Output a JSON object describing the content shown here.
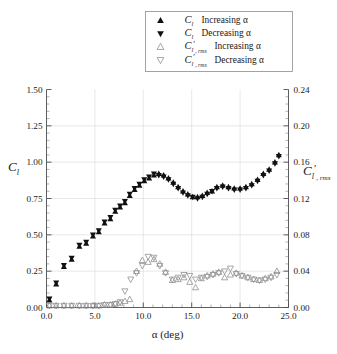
{
  "figure": {
    "background": "#ffffff",
    "marker_fill_color": "#111111",
    "marker_open_stroke_color": "#8a8a8a",
    "grid_color": "#d9d9d9",
    "axis_color": "#4d4d4d"
  },
  "legend": {
    "position": "top-center",
    "entries": [
      {
        "marker": "filled-triangle-up",
        "symbol": "C",
        "symbol_sub": "l",
        "symbol_prime": "",
        "symbol_sub2": "",
        "text": "Increasing α"
      },
      {
        "marker": "filled-triangle-down",
        "symbol": "C",
        "symbol_sub": "l",
        "symbol_prime": "",
        "symbol_sub2": "",
        "text": "Decreasing α"
      },
      {
        "marker": "open-triangle-up",
        "symbol": "C",
        "symbol_sub": "l",
        "symbol_prime": "′",
        "symbol_sub2": ", rms",
        "text": "Increasing α"
      },
      {
        "marker": "open-triangle-down",
        "symbol": "C",
        "symbol_sub": "l",
        "symbol_prime": "′",
        "symbol_sub2": ", rms",
        "text": "Decreasing α"
      }
    ]
  },
  "axes": {
    "x": {
      "label": "α (deg)",
      "min": 0.0,
      "max": 25.0,
      "major_step": 5.0,
      "minor_step": 1.0,
      "tick_labels": [
        "0.0",
        "5.0",
        "10.0",
        "15.0",
        "20.0",
        "25.0"
      ],
      "tick_values": [
        0.0,
        5.0,
        10.0,
        15.0,
        20.0,
        25.0
      ]
    },
    "y_left": {
      "label_symbol": "C",
      "label_sub": "l",
      "label_prime": "",
      "label_sub2": "",
      "min": 0.0,
      "max": 1.5,
      "major_step": 0.25,
      "minor_step": 0.05,
      "tick_labels": [
        "0.00",
        "0.25",
        "0.50",
        "0.75",
        "1.00",
        "1.25",
        "1.50"
      ],
      "tick_values": [
        0.0,
        0.25,
        0.5,
        0.75,
        1.0,
        1.25,
        1.5
      ]
    },
    "y_right": {
      "label_symbol": "C",
      "label_sub": "l",
      "label_prime": "′",
      "label_sub2": ", rms",
      "min": 0.0,
      "max": 0.24,
      "major_step": 0.04,
      "minor_step": 0.008,
      "tick_labels": [
        "0.00",
        "0.04",
        "0.08",
        "0.12",
        "0.16",
        "0.20",
        "0.24"
      ],
      "tick_values": [
        0.0,
        0.04,
        0.08,
        0.12,
        0.16,
        0.2,
        0.24
      ]
    }
  },
  "chart_data": {
    "type": "scatter",
    "title": "",
    "xlabel": "α (deg)",
    "ylabel": "C_l",
    "ylabel_right": "C'_l,rms",
    "xlim": [
      0.0,
      25.0
    ],
    "ylim": [
      0.0,
      1.5
    ],
    "ylim_right": [
      0.0,
      0.24
    ],
    "grid": true,
    "legend_position": "top-center",
    "series": [
      {
        "name": "C_l Increasing α",
        "marker": "filled-triangle-up",
        "axis": "left",
        "x": [
          0.3,
          1.0,
          1.8,
          2.6,
          3.4,
          4.1,
          4.8,
          5.4,
          6.0,
          6.6,
          7.1,
          7.6,
          8.1,
          8.6,
          9.1,
          9.6,
          10.1,
          10.6,
          11.1,
          11.6,
          12.1,
          12.6,
          13.1,
          13.6,
          14.1,
          14.6,
          15.1,
          15.6,
          16.1,
          16.6,
          17.1,
          17.6,
          18.2,
          18.8,
          19.4,
          20.0,
          20.6,
          21.2,
          21.8,
          22.4,
          23.0,
          23.6,
          24.0
        ],
        "y": [
          0.05,
          0.16,
          0.28,
          0.33,
          0.42,
          0.44,
          0.49,
          0.52,
          0.58,
          0.61,
          0.66,
          0.69,
          0.72,
          0.77,
          0.81,
          0.84,
          0.87,
          0.89,
          0.91,
          0.92,
          0.91,
          0.89,
          0.86,
          0.83,
          0.8,
          0.78,
          0.76,
          0.76,
          0.77,
          0.79,
          0.8,
          0.83,
          0.84,
          0.83,
          0.82,
          0.82,
          0.83,
          0.85,
          0.88,
          0.92,
          0.95,
          1.0,
          1.05
        ]
      },
      {
        "name": "C_l Decreasing α",
        "marker": "filled-triangle-down",
        "axis": "left",
        "x": [
          0.3,
          1.0,
          1.8,
          2.6,
          3.4,
          4.1,
          4.8,
          5.4,
          6.0,
          6.6,
          7.1,
          7.6,
          8.1,
          8.6,
          9.1,
          9.6,
          10.1,
          10.6,
          11.1,
          11.6,
          12.1,
          12.6,
          13.1,
          13.6,
          14.1,
          14.6,
          15.1,
          15.6,
          16.1,
          16.6,
          17.1,
          17.6,
          18.2,
          18.8,
          19.4,
          20.0,
          20.6,
          21.2,
          21.8,
          22.4,
          23.0,
          23.6,
          24.0
        ],
        "y": [
          0.06,
          0.17,
          0.29,
          0.34,
          0.43,
          0.45,
          0.5,
          0.53,
          0.59,
          0.62,
          0.67,
          0.7,
          0.73,
          0.78,
          0.82,
          0.85,
          0.88,
          0.9,
          0.92,
          0.91,
          0.9,
          0.88,
          0.85,
          0.82,
          0.79,
          0.77,
          0.76,
          0.75,
          0.76,
          0.78,
          0.8,
          0.82,
          0.83,
          0.82,
          0.81,
          0.81,
          0.82,
          0.84,
          0.87,
          0.91,
          0.94,
          0.99,
          1.04
        ]
      },
      {
        "name": "C'_l,rms Increasing α",
        "marker": "open-triangle-up",
        "axis": "right",
        "x": [
          0.3,
          1.0,
          1.8,
          2.6,
          3.4,
          4.1,
          4.8,
          5.4,
          6.0,
          6.6,
          7.1,
          7.6,
          8.1,
          8.6,
          9.3,
          9.9,
          10.5,
          11.1,
          11.7,
          12.3,
          13.0,
          13.6,
          14.2,
          14.8,
          15.4,
          16.0,
          16.6,
          17.2,
          17.8,
          18.4,
          19.0,
          19.6,
          20.2,
          20.8,
          21.4,
          22.0,
          22.6,
          23.2,
          23.8
        ],
        "y": [
          0.002,
          0.002,
          0.002,
          0.002,
          0.002,
          0.002,
          0.002,
          0.002,
          0.003,
          0.003,
          0.004,
          0.005,
          0.007,
          0.009,
          0.04,
          0.052,
          0.05,
          0.053,
          0.048,
          0.039,
          0.03,
          0.031,
          0.033,
          0.028,
          0.022,
          0.032,
          0.035,
          0.037,
          0.039,
          0.033,
          0.036,
          0.038,
          0.035,
          0.033,
          0.031,
          0.03,
          0.032,
          0.034,
          0.04
        ]
      },
      {
        "name": "C'_l,rms Decreasing α",
        "marker": "open-triangle-down",
        "axis": "right",
        "x": [
          0.3,
          1.0,
          1.8,
          2.6,
          3.4,
          4.1,
          4.8,
          5.4,
          6.0,
          6.6,
          7.1,
          7.6,
          8.1,
          8.7,
          9.3,
          9.9,
          10.5,
          11.1,
          11.7,
          12.3,
          13.0,
          13.6,
          14.2,
          14.8,
          15.4,
          16.0,
          16.6,
          17.2,
          17.8,
          18.4,
          19.0,
          19.6,
          20.2,
          20.8,
          21.4,
          22.0,
          22.6,
          23.2,
          23.8
        ],
        "y": [
          0.002,
          0.002,
          0.002,
          0.002,
          0.002,
          0.002,
          0.002,
          0.002,
          0.003,
          0.003,
          0.004,
          0.006,
          0.018,
          0.031,
          0.038,
          0.046,
          0.056,
          0.055,
          0.046,
          0.038,
          0.031,
          0.033,
          0.036,
          0.035,
          0.031,
          0.033,
          0.034,
          0.036,
          0.038,
          0.04,
          0.043,
          0.037,
          0.035,
          0.033,
          0.031,
          0.03,
          0.031,
          0.033,
          0.036
        ]
      }
    ]
  }
}
